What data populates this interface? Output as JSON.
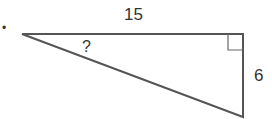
{
  "diagram": {
    "type": "right-triangle",
    "bullet": "•",
    "top_side_label": "15",
    "right_side_label": "6",
    "angle_label": "?",
    "stroke_color": "#555555"
  }
}
